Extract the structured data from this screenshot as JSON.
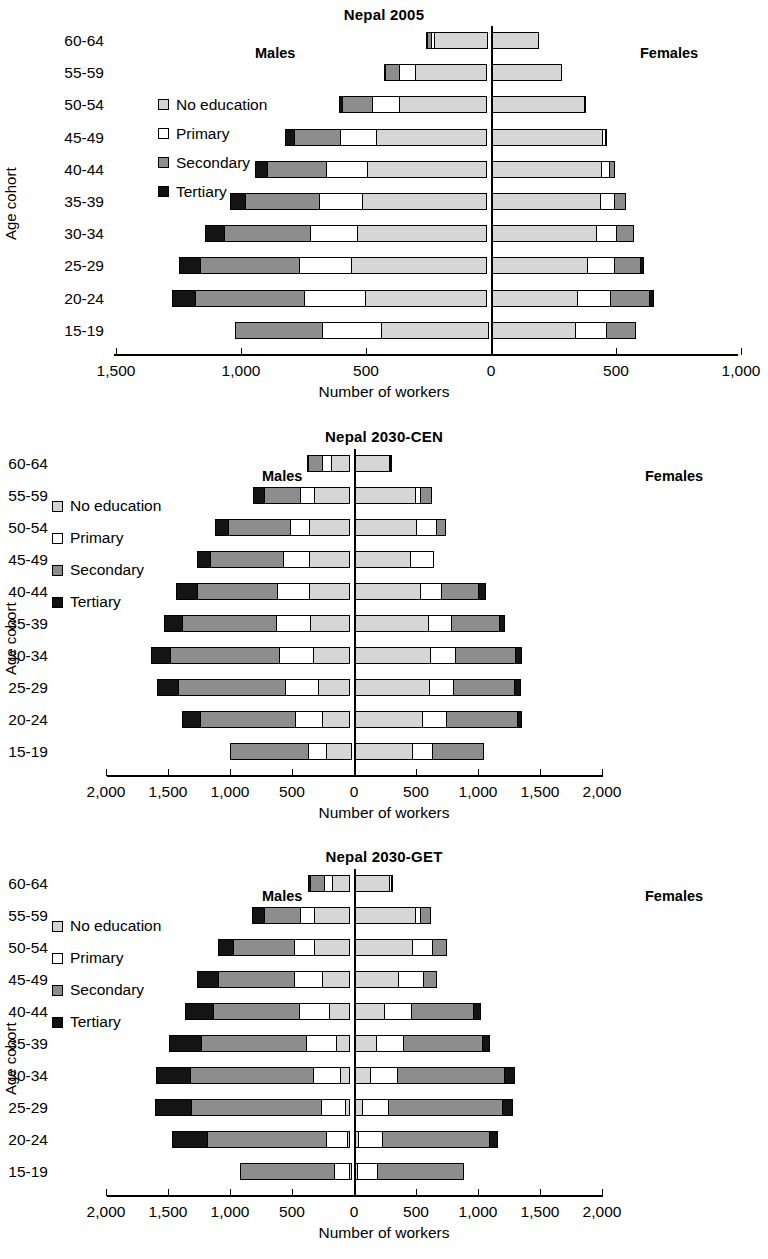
{
  "figure": {
    "axis_title": "Number of workers",
    "y_axis_label": "Age cohort",
    "male_label": "Males",
    "female_label": "Females",
    "cohorts": [
      "60-64",
      "55-59",
      "50-54",
      "45-49",
      "40-44",
      "35-39",
      "30-34",
      "25-29",
      "20-24",
      "15-19"
    ],
    "legend": [
      {
        "label": "No education",
        "key": "none",
        "color": "#d6d6d6"
      },
      {
        "label": "Primary",
        "key": "primary",
        "color": "#ffffff"
      },
      {
        "label": "Secondary",
        "key": "secondary",
        "color": "#8d8d8d"
      },
      {
        "label": "Tertiary",
        "key": "tertiary",
        "color": "#141414"
      }
    ]
  },
  "chart_data": [
    {
      "type": "bar",
      "title": "Nepal 2005",
      "xlabel": "Number of workers",
      "ylabel": "Age cohort",
      "orientation": "horizontal-diverging",
      "grid": false,
      "legend_position": "inside-left",
      "xlim": [
        -1500,
        1000
      ],
      "xticks": [
        -1500,
        -1000,
        -500,
        0,
        500,
        1000
      ],
      "xticklabels": [
        "1,500",
        "1,000",
        "500",
        "0",
        "500",
        "1,000"
      ],
      "categories": [
        "60-64",
        "55-59",
        "50-54",
        "45-49",
        "40-44",
        "35-39",
        "30-34",
        "25-29",
        "20-24",
        "15-19"
      ],
      "series": [
        {
          "name": "Males No education",
          "side": "male",
          "key": "none",
          "values": [
            215,
            290,
            355,
            445,
            480,
            500,
            520,
            545,
            490,
            430
          ]
        },
        {
          "name": "Males Primary",
          "side": "male",
          "key": "primary",
          "values": [
            20,
            70,
            110,
            150,
            170,
            180,
            195,
            215,
            250,
            240
          ]
        },
        {
          "name": "Males Secondary",
          "side": "male",
          "key": "secondary",
          "values": [
            20,
            60,
            125,
            190,
            240,
            300,
            350,
            400,
            440,
            355
          ]
        },
        {
          "name": "Males Tertiary",
          "side": "male",
          "key": "tertiary",
          "values": [
            5,
            10,
            20,
            40,
            55,
            65,
            80,
            90,
            95,
            0
          ]
        },
        {
          "name": "Females No education",
          "side": "female",
          "key": "none",
          "values": [
            190,
            285,
            375,
            450,
            445,
            440,
            425,
            390,
            350,
            340
          ]
        },
        {
          "name": "Females Primary",
          "side": "female",
          "key": "primary",
          "values": [
            0,
            0,
            0,
            15,
            35,
            60,
            85,
            110,
            135,
            130
          ]
        },
        {
          "name": "Females Secondary",
          "side": "female",
          "key": "secondary",
          "values": [
            0,
            0,
            10,
            5,
            25,
            50,
            70,
            110,
            160,
            120
          ]
        },
        {
          "name": "Females Tertiary",
          "side": "female",
          "key": "tertiary",
          "values": [
            0,
            0,
            0,
            0,
            0,
            0,
            0,
            15,
            20,
            0
          ]
        }
      ]
    },
    {
      "type": "bar",
      "title": "Nepal 2030-CEN",
      "xlabel": "Number of workers",
      "ylabel": "Age cohort",
      "orientation": "horizontal-diverging",
      "grid": false,
      "legend_position": "inside-left",
      "xlim": [
        -2000,
        2000
      ],
      "xticks": [
        -2000,
        -1500,
        -1000,
        -500,
        0,
        500,
        1000,
        1500,
        2000
      ],
      "xticklabels": [
        "2,000",
        "1,500",
        "1,000",
        "500",
        "0",
        "500",
        "1,000",
        "1,500",
        "2,000"
      ],
      "categories": [
        "60-64",
        "55-59",
        "50-54",
        "45-49",
        "40-44",
        "35-39",
        "30-34",
        "25-29",
        "20-24",
        "15-19"
      ],
      "series": [
        {
          "name": "Males No education",
          "side": "male",
          "key": "none",
          "values": [
            160,
            290,
            335,
            330,
            335,
            330,
            300,
            265,
            230,
            205
          ]
        },
        {
          "name": "Males Primary",
          "side": "male",
          "key": "primary",
          "values": [
            75,
            125,
            165,
            225,
            265,
            280,
            285,
            270,
            230,
            160
          ]
        },
        {
          "name": "Males Secondary",
          "side": "male",
          "key": "secondary",
          "values": [
            125,
            300,
            505,
            600,
            655,
            765,
            890,
            875,
            770,
            635
          ]
        },
        {
          "name": "Males Tertiary",
          "side": "male",
          "key": "tertiary",
          "values": [
            20,
            100,
            120,
            115,
            180,
            155,
            165,
            180,
            155,
            0
          ]
        },
        {
          "name": "Females No education",
          "side": "female",
          "key": "none",
          "values": [
            290,
            500,
            510,
            460,
            540,
            605,
            625,
            615,
            560,
            480
          ]
        },
        {
          "name": "Females Primary",
          "side": "female",
          "key": "primary",
          "values": [
            20,
            55,
            170,
            195,
            180,
            195,
            205,
            205,
            200,
            170
          ]
        },
        {
          "name": "Females Secondary",
          "side": "female",
          "key": "secondary",
          "values": [
            10,
            90,
            80,
            0,
            310,
            400,
            495,
            500,
            580,
            420
          ]
        },
        {
          "name": "Females Tertiary",
          "side": "female",
          "key": "tertiary",
          "values": [
            0,
            0,
            0,
            0,
            60,
            45,
            60,
            55,
            45,
            0
          ]
        }
      ]
    },
    {
      "type": "bar",
      "title": "Nepal 2030-GET",
      "xlabel": "Number of workers",
      "ylabel": "Age cohort",
      "orientation": "horizontal-diverging",
      "grid": false,
      "legend_position": "inside-left",
      "xlim": [
        -2000,
        2000
      ],
      "xticks": [
        -2000,
        -1500,
        -1000,
        -500,
        0,
        500,
        1000,
        1500,
        2000
      ],
      "xticklabels": [
        "2,000",
        "1,500",
        "1,000",
        "500",
        "0",
        "500",
        "1,000",
        "1,500",
        "2,000"
      ],
      "categories": [
        "60-64",
        "55-59",
        "50-54",
        "45-49",
        "40-44",
        "35-39",
        "30-34",
        "25-29",
        "20-24",
        "15-19"
      ],
      "series": [
        {
          "name": "Males No education",
          "side": "male",
          "key": "none",
          "values": [
            150,
            290,
            295,
            230,
            175,
            120,
            85,
            40,
            25,
            20
          ]
        },
        {
          "name": "Males Primary",
          "side": "male",
          "key": "primary",
          "values": [
            75,
            125,
            170,
            235,
            250,
            245,
            230,
            205,
            185,
            130
          ]
        },
        {
          "name": "Males Secondary",
          "side": "male",
          "key": "secondary",
          "values": [
            120,
            300,
            500,
            620,
            700,
            860,
            1000,
            1060,
            965,
            770
          ]
        },
        {
          "name": "Males Tertiary",
          "side": "male",
          "key": "tertiary",
          "values": [
            25,
            105,
            130,
            185,
            240,
            270,
            285,
            300,
            290,
            0
          ]
        },
        {
          "name": "Females No education",
          "side": "female",
          "key": "none",
          "values": [
            295,
            500,
            475,
            365,
            255,
            190,
            140,
            75,
            45,
            35
          ]
        },
        {
          "name": "Females Primary",
          "side": "female",
          "key": "primary",
          "values": [
            25,
            50,
            175,
            210,
            225,
            225,
            225,
            215,
            200,
            170
          ]
        },
        {
          "name": "Females Secondary",
          "side": "female",
          "key": "secondary",
          "values": [
            10,
            90,
            120,
            110,
            505,
            645,
            875,
            935,
            870,
            700
          ]
        },
        {
          "name": "Females Tertiary",
          "side": "female",
          "key": "tertiary",
          "values": [
            0,
            0,
            0,
            0,
            70,
            65,
            90,
            85,
            75,
            0
          ]
        }
      ]
    }
  ]
}
